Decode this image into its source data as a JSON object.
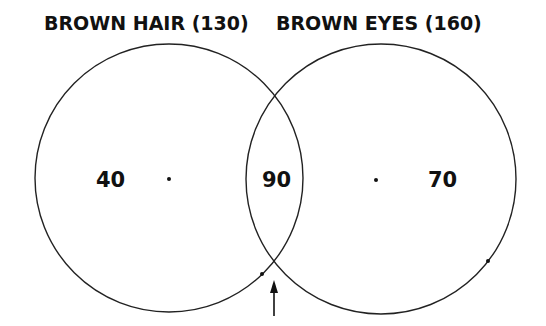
{
  "diagram": {
    "type": "venn",
    "sets": [
      {
        "label": "BROWN HAIR (130)",
        "name": "Brown Hair",
        "total": 130,
        "only": "40"
      },
      {
        "label": "BROWN EYES (160)",
        "name": "Brown Eyes",
        "total": 160,
        "only": "70"
      }
    ],
    "intersection": "90",
    "annotation": "arrow pointing to lower intersection point"
  }
}
